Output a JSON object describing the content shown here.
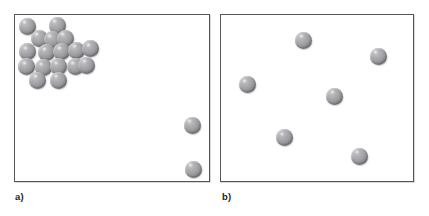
{
  "figure": {
    "background_color": "#ffffff",
    "width": 429,
    "height": 216,
    "sphere_color": "#9a9a9f",
    "box_border_color": "#555558",
    "sphere_diameter": 17
  },
  "panels": [
    {
      "id": "panel-a",
      "label": "a)",
      "box": {
        "x": 14,
        "y": 14,
        "width": 196,
        "height": 168
      },
      "label_pos": {
        "x": 15,
        "y": 191
      },
      "sphere_count": 19,
      "description": "clustered particles in upper-left with two isolated particles at right",
      "spheres": [
        {
          "cx": 26,
          "cy": 25
        },
        {
          "cx": 56,
          "cy": 24
        },
        {
          "cx": 38,
          "cy": 37
        },
        {
          "cx": 51,
          "cy": 38.5
        },
        {
          "cx": 64,
          "cy": 37
        },
        {
          "cx": 26.7,
          "cy": 50.7
        },
        {
          "cx": 45.7,
          "cy": 51.3
        },
        {
          "cx": 60.7,
          "cy": 50.7
        },
        {
          "cx": 75.7,
          "cy": 49
        },
        {
          "cx": 89.7,
          "cy": 47.3
        },
        {
          "cx": 25.7,
          "cy": 65.7
        },
        {
          "cx": 42.3,
          "cy": 66.7
        },
        {
          "cx": 57.3,
          "cy": 65.7
        },
        {
          "cx": 74,
          "cy": 65.7
        },
        {
          "cx": 85.7,
          "cy": 64
        },
        {
          "cx": 36.7,
          "cy": 79
        },
        {
          "cx": 57.3,
          "cy": 79
        },
        {
          "cx": 191,
          "cy": 124
        },
        {
          "cx": 192,
          "cy": 168
        }
      ]
    },
    {
      "id": "panel-b",
      "label": "b)",
      "box": {
        "x": 220,
        "y": 14,
        "width": 194,
        "height": 168
      },
      "label_pos": {
        "x": 222,
        "y": 191
      },
      "sphere_count": 6,
      "description": "six evenly dispersed particles",
      "spheres": [
        {
          "cx": 302.7,
          "cy": 39
        },
        {
          "cx": 377,
          "cy": 55
        },
        {
          "cx": 246,
          "cy": 83.3
        },
        {
          "cx": 333.7,
          "cy": 95
        },
        {
          "cx": 283.3,
          "cy": 136.7
        },
        {
          "cx": 358.3,
          "cy": 155
        }
      ]
    }
  ]
}
